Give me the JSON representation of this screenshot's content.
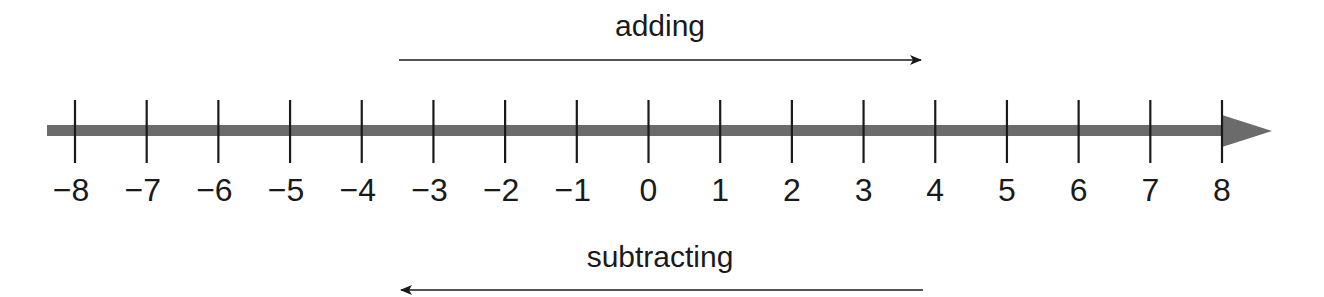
{
  "diagram": {
    "type": "number-line",
    "range": [
      -8,
      8
    ],
    "ticks": [
      "−8",
      "−7",
      "−6",
      "−5",
      "−4",
      "−3",
      "−2",
      "−1",
      "0",
      "1",
      "2",
      "3",
      "4",
      "5",
      "6",
      "7",
      "8"
    ],
    "top_arrow": {
      "label": "adding",
      "direction": "right"
    },
    "bottom_arrow": {
      "label": "subtracting",
      "direction": "left"
    },
    "colors": {
      "axis": "#6b6b6b",
      "ticks": "#1a1a1a",
      "arrows": "#1a1a1a",
      "text": "#1a1a1a"
    }
  }
}
